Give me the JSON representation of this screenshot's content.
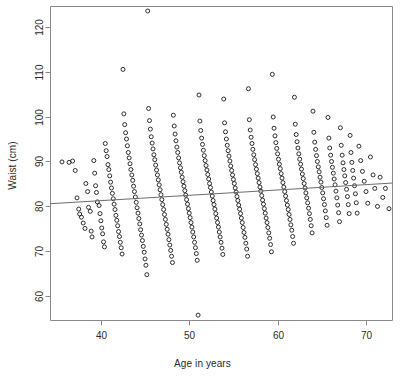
{
  "figure": {
    "title": "",
    "background_color": "#ffffff",
    "frame_color": "#8a8a8a",
    "point_color": "#1a1a1a",
    "line_color": "#6d6d6d",
    "text_color": "#2b2b2b"
  },
  "axes": {
    "x_title": "Age in years",
    "y_title": "Waist (cm)",
    "x_ticks": [
      "40",
      "50",
      "60",
      "70"
    ],
    "y_ticks": [
      "60",
      "70",
      "80",
      "90",
      "100",
      "110",
      "120"
    ]
  },
  "chart_data": {
    "type": "scatter",
    "title": "",
    "xlabel": "Age in years",
    "ylabel": "Waist (cm)",
    "xlim": [
      34.3,
      73.0
    ],
    "ylim": [
      54.6,
      124.5
    ],
    "x_ticks": [
      40,
      50,
      60,
      70
    ],
    "y_ticks": [
      60,
      70,
      80,
      90,
      100,
      110,
      120
    ],
    "grid": false,
    "legend": "none",
    "marker": "open-circle",
    "marker_size": 4,
    "n_points": 500,
    "trend_line": {
      "type": "linear-fit",
      "x_start": 34.3,
      "y_start": 80.6,
      "x_end": 73.0,
      "y_end": 85.2,
      "slope": 0.119,
      "intercept": 76.5
    },
    "points": [
      [
        35.6,
        89.9
      ],
      [
        36.4,
        89.8
      ],
      [
        36.8,
        90.1
      ],
      [
        37.1,
        88.0
      ],
      [
        37.3,
        81.9
      ],
      [
        37.5,
        79.4
      ],
      [
        37.6,
        78.3
      ],
      [
        37.8,
        77.6
      ],
      [
        38.0,
        76.3
      ],
      [
        38.2,
        75.1
      ],
      [
        38.3,
        85.1
      ],
      [
        38.5,
        83.3
      ],
      [
        38.6,
        79.8
      ],
      [
        38.8,
        78.9
      ],
      [
        38.9,
        74.5
      ],
      [
        39.0,
        73.2
      ],
      [
        39.2,
        90.2
      ],
      [
        39.3,
        87.4
      ],
      [
        39.4,
        84.6
      ],
      [
        39.5,
        83.1
      ],
      [
        39.6,
        81.0
      ],
      [
        39.8,
        80.2
      ],
      [
        39.9,
        78.4
      ],
      [
        40.0,
        76.8
      ],
      [
        40.1,
        75.2
      ],
      [
        40.2,
        73.9
      ],
      [
        40.3,
        72.1
      ],
      [
        40.4,
        71.0
      ],
      [
        40.5,
        94.0
      ],
      [
        40.6,
        92.4
      ],
      [
        40.7,
        91.1
      ],
      [
        40.8,
        89.3
      ],
      [
        40.9,
        88.2
      ],
      [
        41.0,
        86.8
      ],
      [
        41.1,
        85.4
      ],
      [
        41.2,
        84.1
      ],
      [
        41.3,
        82.9
      ],
      [
        41.4,
        81.7
      ],
      [
        41.5,
        80.5
      ],
      [
        41.6,
        79.3
      ],
      [
        41.7,
        78.0
      ],
      [
        41.8,
        76.9
      ],
      [
        41.9,
        75.7
      ],
      [
        42.0,
        74.4
      ],
      [
        42.1,
        73.3
      ],
      [
        42.2,
        72.0
      ],
      [
        42.3,
        70.8
      ],
      [
        42.4,
        69.4
      ],
      [
        42.5,
        110.5
      ],
      [
        42.6,
        100.6
      ],
      [
        42.7,
        98.2
      ],
      [
        42.8,
        96.4
      ],
      [
        42.9,
        95.0
      ],
      [
        43.0,
        93.5
      ],
      [
        43.1,
        92.0
      ],
      [
        43.2,
        90.8
      ],
      [
        43.3,
        89.5
      ],
      [
        43.4,
        88.2
      ],
      [
        43.5,
        87.0
      ],
      [
        43.6,
        85.8
      ],
      [
        43.7,
        84.5
      ],
      [
        43.8,
        83.3
      ],
      [
        43.9,
        82.1
      ],
      [
        44.0,
        80.9
      ],
      [
        44.1,
        79.7
      ],
      [
        44.2,
        78.5
      ],
      [
        44.3,
        77.3
      ],
      [
        44.4,
        76.1
      ],
      [
        44.5,
        74.8
      ],
      [
        44.6,
        73.6
      ],
      [
        44.7,
        72.4
      ],
      [
        44.8,
        71.1
      ],
      [
        44.9,
        69.8
      ],
      [
        45.0,
        68.3
      ],
      [
        45.1,
        66.9
      ],
      [
        45.2,
        64.8
      ],
      [
        45.3,
        123.5
      ],
      [
        45.4,
        101.8
      ],
      [
        45.5,
        99.1
      ],
      [
        45.6,
        97.2
      ],
      [
        45.7,
        95.5
      ],
      [
        45.8,
        94.1
      ],
      [
        45.9,
        92.8
      ],
      [
        46.0,
        91.5
      ],
      [
        46.1,
        90.4
      ],
      [
        46.2,
        89.2
      ],
      [
        46.3,
        88.1
      ],
      [
        46.4,
        87.0
      ],
      [
        46.5,
        85.9
      ],
      [
        46.6,
        84.8
      ],
      [
        46.7,
        83.7
      ],
      [
        46.8,
        82.6
      ],
      [
        46.9,
        81.5
      ],
      [
        47.0,
        80.4
      ],
      [
        47.1,
        79.3
      ],
      [
        47.2,
        78.2
      ],
      [
        47.3,
        77.1
      ],
      [
        47.4,
        76.0
      ],
      [
        47.5,
        74.9
      ],
      [
        47.6,
        73.8
      ],
      [
        47.7,
        72.6
      ],
      [
        47.8,
        71.4
      ],
      [
        47.9,
        70.2
      ],
      [
        48.0,
        68.9
      ],
      [
        48.1,
        67.5
      ],
      [
        48.2,
        100.3
      ],
      [
        48.3,
        97.9
      ],
      [
        48.4,
        96.1
      ],
      [
        48.5,
        94.6
      ],
      [
        48.6,
        93.2
      ],
      [
        48.7,
        92.0
      ],
      [
        48.8,
        90.8
      ],
      [
        48.9,
        89.7
      ],
      [
        49.0,
        88.6
      ],
      [
        49.1,
        87.6
      ],
      [
        49.2,
        86.5
      ],
      [
        49.3,
        85.5
      ],
      [
        49.4,
        84.5
      ],
      [
        49.5,
        83.5
      ],
      [
        49.6,
        82.5
      ],
      [
        49.7,
        81.5
      ],
      [
        49.8,
        80.5
      ],
      [
        49.9,
        79.5
      ],
      [
        50.0,
        78.5
      ],
      [
        50.1,
        77.5
      ],
      [
        50.2,
        76.4
      ],
      [
        50.3,
        75.4
      ],
      [
        50.4,
        74.3
      ],
      [
        50.5,
        73.2
      ],
      [
        50.6,
        72.0
      ],
      [
        50.7,
        70.8
      ],
      [
        50.8,
        69.5
      ],
      [
        50.9,
        68.0
      ],
      [
        51.0,
        55.8
      ],
      [
        51.1,
        104.8
      ],
      [
        51.2,
        99.0
      ],
      [
        51.3,
        96.9
      ],
      [
        51.4,
        95.2
      ],
      [
        51.5,
        93.8
      ],
      [
        51.6,
        92.5
      ],
      [
        51.7,
        91.3
      ],
      [
        51.8,
        90.2
      ],
      [
        51.9,
        89.1
      ],
      [
        52.0,
        88.1
      ],
      [
        52.1,
        87.1
      ],
      [
        52.2,
        86.1
      ],
      [
        52.3,
        85.1
      ],
      [
        52.4,
        84.2
      ],
      [
        52.5,
        83.2
      ],
      [
        52.6,
        82.3
      ],
      [
        52.7,
        81.3
      ],
      [
        52.8,
        80.4
      ],
      [
        52.9,
        79.4
      ],
      [
        53.0,
        78.4
      ],
      [
        53.1,
        77.4
      ],
      [
        53.2,
        76.4
      ],
      [
        53.3,
        75.4
      ],
      [
        53.4,
        74.3
      ],
      [
        53.5,
        73.2
      ],
      [
        53.6,
        72.0
      ],
      [
        53.7,
        70.7
      ],
      [
        53.8,
        69.3
      ],
      [
        53.9,
        103.9
      ],
      [
        54.0,
        98.6
      ],
      [
        54.1,
        96.6
      ],
      [
        54.2,
        95.0
      ],
      [
        54.3,
        93.6
      ],
      [
        54.4,
        92.4
      ],
      [
        54.5,
        91.2
      ],
      [
        54.6,
        90.1
      ],
      [
        54.7,
        89.0
      ],
      [
        54.8,
        88.0
      ],
      [
        54.9,
        87.0
      ],
      [
        55.0,
        86.0
      ],
      [
        55.1,
        85.1
      ],
      [
        55.2,
        84.1
      ],
      [
        55.3,
        83.2
      ],
      [
        55.4,
        82.2
      ],
      [
        55.5,
        81.3
      ],
      [
        55.6,
        80.3
      ],
      [
        55.7,
        79.4
      ],
      [
        55.8,
        78.4
      ],
      [
        55.9,
        77.4
      ],
      [
        56.0,
        76.4
      ],
      [
        56.1,
        75.3
      ],
      [
        56.2,
        74.2
      ],
      [
        56.3,
        73.1
      ],
      [
        56.4,
        71.8
      ],
      [
        56.5,
        70.5
      ],
      [
        56.6,
        68.9
      ],
      [
        56.7,
        106.2
      ],
      [
        56.8,
        99.3
      ],
      [
        56.9,
        97.0
      ],
      [
        57.0,
        95.4
      ],
      [
        57.1,
        94.0
      ],
      [
        57.2,
        92.7
      ],
      [
        57.3,
        91.5
      ],
      [
        57.4,
        90.4
      ],
      [
        57.5,
        89.3
      ],
      [
        57.6,
        88.3
      ],
      [
        57.7,
        87.3
      ],
      [
        57.8,
        86.3
      ],
      [
        57.9,
        85.3
      ],
      [
        58.0,
        84.3
      ],
      [
        58.1,
        83.4
      ],
      [
        58.2,
        82.4
      ],
      [
        58.3,
        81.4
      ],
      [
        58.4,
        80.5
      ],
      [
        58.5,
        79.5
      ],
      [
        58.6,
        78.5
      ],
      [
        58.7,
        77.4
      ],
      [
        58.8,
        76.4
      ],
      [
        58.9,
        75.3
      ],
      [
        59.0,
        74.1
      ],
      [
        59.1,
        72.9
      ],
      [
        59.2,
        71.5
      ],
      [
        59.3,
        69.9
      ],
      [
        59.4,
        109.4
      ],
      [
        59.5,
        99.9
      ],
      [
        59.6,
        97.4
      ],
      [
        59.7,
        95.7
      ],
      [
        59.8,
        94.2
      ],
      [
        59.9,
        92.9
      ],
      [
        60.0,
        91.7
      ],
      [
        60.1,
        90.5
      ],
      [
        60.2,
        89.4
      ],
      [
        60.3,
        88.4
      ],
      [
        60.4,
        87.3
      ],
      [
        60.5,
        86.3
      ],
      [
        60.6,
        85.3
      ],
      [
        60.7,
        84.3
      ],
      [
        60.8,
        83.3
      ],
      [
        60.9,
        82.3
      ],
      [
        61.0,
        81.3
      ],
      [
        61.1,
        80.3
      ],
      [
        61.2,
        79.3
      ],
      [
        61.3,
        78.2
      ],
      [
        61.4,
        77.1
      ],
      [
        61.5,
        75.9
      ],
      [
        61.6,
        74.7
      ],
      [
        61.7,
        73.3
      ],
      [
        61.8,
        71.8
      ],
      [
        61.9,
        104.3
      ],
      [
        62.0,
        98.3
      ],
      [
        62.1,
        96.0
      ],
      [
        62.2,
        94.4
      ],
      [
        62.3,
        93.0
      ],
      [
        62.4,
        91.7
      ],
      [
        62.5,
        90.5
      ],
      [
        62.6,
        89.4
      ],
      [
        62.7,
        88.3
      ],
      [
        62.8,
        87.2
      ],
      [
        62.9,
        86.2
      ],
      [
        63.0,
        85.1
      ],
      [
        63.1,
        84.1
      ],
      [
        63.2,
        83.0
      ],
      [
        63.3,
        81.9
      ],
      [
        63.4,
        80.8
      ],
      [
        63.5,
        79.6
      ],
      [
        63.6,
        78.4
      ],
      [
        63.7,
        77.1
      ],
      [
        63.8,
        75.7
      ],
      [
        63.9,
        74.1
      ],
      [
        64.0,
        101.2
      ],
      [
        64.1,
        96.5
      ],
      [
        64.2,
        94.3
      ],
      [
        64.3,
        92.7
      ],
      [
        64.4,
        91.3
      ],
      [
        64.5,
        90.0
      ],
      [
        64.6,
        88.8
      ],
      [
        64.7,
        87.7
      ],
      [
        64.8,
        86.5
      ],
      [
        64.9,
        85.4
      ],
      [
        65.0,
        84.2
      ],
      [
        65.1,
        83.0
      ],
      [
        65.2,
        81.7
      ],
      [
        65.3,
        80.4
      ],
      [
        65.4,
        79.0
      ],
      [
        65.5,
        77.5
      ],
      [
        65.6,
        75.8
      ],
      [
        65.7,
        99.8
      ],
      [
        65.8,
        95.2
      ],
      [
        65.9,
        93.0
      ],
      [
        66.0,
        91.4
      ],
      [
        66.1,
        90.0
      ],
      [
        66.2,
        88.7
      ],
      [
        66.3,
        87.4
      ],
      [
        66.4,
        86.1
      ],
      [
        66.5,
        84.8
      ],
      [
        66.6,
        83.4
      ],
      [
        66.7,
        81.9
      ],
      [
        66.8,
        80.3
      ],
      [
        66.9,
        78.6
      ],
      [
        67.0,
        76.6
      ],
      [
        67.1,
        97.5
      ],
      [
        67.2,
        93.6
      ],
      [
        67.3,
        91.4
      ],
      [
        67.4,
        89.7
      ],
      [
        67.5,
        88.2
      ],
      [
        67.6,
        86.8
      ],
      [
        67.7,
        85.3
      ],
      [
        67.8,
        83.8
      ],
      [
        67.9,
        82.2
      ],
      [
        68.0,
        80.4
      ],
      [
        68.1,
        78.4
      ],
      [
        68.2,
        95.8
      ],
      [
        68.3,
        92.0
      ],
      [
        68.4,
        89.8
      ],
      [
        68.5,
        88.0
      ],
      [
        68.6,
        86.3
      ],
      [
        68.7,
        84.6
      ],
      [
        68.8,
        82.8
      ],
      [
        68.9,
        80.8
      ],
      [
        69.0,
        78.5
      ],
      [
        69.2,
        93.4
      ],
      [
        69.4,
        90.2
      ],
      [
        69.6,
        87.8
      ],
      [
        69.8,
        85.6
      ],
      [
        70.0,
        83.3
      ],
      [
        70.2,
        80.7
      ],
      [
        70.5,
        91.0
      ],
      [
        70.8,
        87.0
      ],
      [
        71.0,
        84.0
      ],
      [
        71.3,
        80.0
      ],
      [
        71.6,
        86.5
      ],
      [
        71.9,
        82.0
      ],
      [
        72.2,
        84.0
      ],
      [
        72.6,
        79.5
      ]
    ]
  }
}
